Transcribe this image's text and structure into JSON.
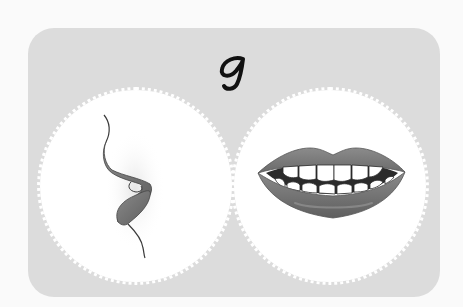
{
  "card": {
    "letter": "g",
    "background_color": "#dcdcdc",
    "circle_color": "#ffffff"
  },
  "illustrations": [
    {
      "name": "side-view-lips",
      "description": "Side profile of lips (phonetic articulation view)",
      "lip_color": "#6e6e6e"
    },
    {
      "name": "front-view-mouth",
      "description": "Front view of open mouth showing upper and lower teeth",
      "lip_color": "#737373",
      "teeth_color": "#ffffff",
      "mouth_interior_color": "#2b2b2b"
    }
  ]
}
